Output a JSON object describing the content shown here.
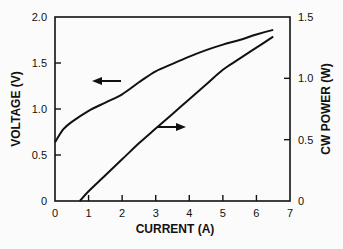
{
  "chart_data": {
    "type": "line",
    "title": "",
    "xlabel": "CURRENT (A)",
    "ylabel": "VOLTAGE (V)",
    "y2label": "CW POWER (W)",
    "xlim": [
      0,
      7
    ],
    "ylim": [
      0,
      2.0
    ],
    "y2lim": [
      0,
      1.5
    ],
    "x_ticks": [
      "0",
      "1",
      "2",
      "3",
      "4",
      "5",
      "6",
      "7"
    ],
    "y_ticks": [
      "0",
      "0.5",
      "1.0",
      "1.5",
      "2.0"
    ],
    "y2_ticks": [
      "0",
      "0.5",
      "1.0",
      "1.5"
    ],
    "grid": false,
    "legend": "none (arrows indicate axis association)",
    "series": [
      {
        "name": "Voltage",
        "axis": "left",
        "arrow": "left",
        "x": [
          0,
          0.25,
          0.5,
          1,
          1.5,
          2,
          2.5,
          3,
          3.5,
          4,
          4.5,
          5,
          5.5,
          6,
          6.5
        ],
        "values": [
          0.64,
          0.78,
          0.86,
          0.98,
          1.07,
          1.16,
          1.29,
          1.41,
          1.49,
          1.57,
          1.64,
          1.7,
          1.75,
          1.81,
          1.86
        ]
      },
      {
        "name": "CW Power",
        "axis": "right",
        "arrow": "right",
        "x": [
          0.74,
          1,
          1.5,
          2,
          2.5,
          3,
          3.5,
          4,
          4.5,
          5,
          5.5,
          6,
          6.5
        ],
        "values": [
          0,
          0.08,
          0.21,
          0.34,
          0.47,
          0.59,
          0.71,
          0.83,
          0.95,
          1.07,
          1.16,
          1.25,
          1.34
        ]
      }
    ]
  },
  "labels": {
    "xlabel": "CURRENT (A)",
    "ylabel": "VOLTAGE (V)",
    "y2label": "CW POWER (W)"
  }
}
